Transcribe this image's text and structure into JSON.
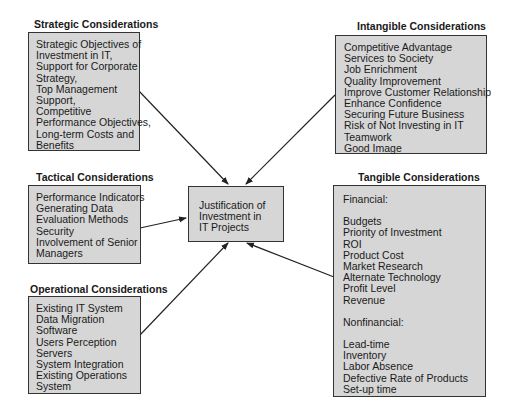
{
  "center": {
    "lines": [
      "Justification of",
      "Investment in",
      "IT Projects"
    ]
  },
  "strategic": {
    "title": "Strategic Considerations",
    "lines": [
      "Strategic Objectives of",
      "Investment in IT,",
      "Support for Corporate",
      "Strategy,",
      "Top Management",
      "Support,",
      "Competitive",
      "Performance Objectives,",
      "Long-term Costs and",
      "Benefits"
    ]
  },
  "tactical": {
    "title": "Tactical Considerations",
    "lines": [
      "Performance Indicators",
      "Generating Data",
      "Evaluation Methods",
      "Security",
      "Involvement of Senior",
      "Managers"
    ]
  },
  "operational": {
    "title": "Operational Considerations",
    "lines": [
      "Existing IT System",
      "Data Migration",
      "Software",
      "Users Perception",
      "Servers",
      "System Integration",
      "Existing Operations",
      "System"
    ]
  },
  "intangible": {
    "title": "Intangible Considerations",
    "lines": [
      "Competitive Advantage",
      "Services to Society",
      "Job Enrichment",
      "Quality Improvement",
      "Improve Customer Relationship",
      "Enhance Confidence",
      "Securing Future Business",
      "Risk of Not Investing in IT",
      "Teamwork",
      "Good Image"
    ]
  },
  "tangible": {
    "title": "Tangible Considerations",
    "financial_heading": "Financial:",
    "financial": [
      "Budgets",
      "Priority of Investment",
      "ROI",
      "Product Cost",
      "Market Research",
      "Alternate Technology",
      "Profit Level",
      "Revenue"
    ],
    "nonfinancial_heading": "Nonfinancial:",
    "nonfinancial": [
      "Lead-time",
      "Inventory",
      "Labor Absence",
      "Defective Rate of Products",
      "Set-up time"
    ]
  },
  "colors": {
    "box_fill": "#d6d6d6",
    "border": "#333333",
    "arrow": "#222222"
  }
}
